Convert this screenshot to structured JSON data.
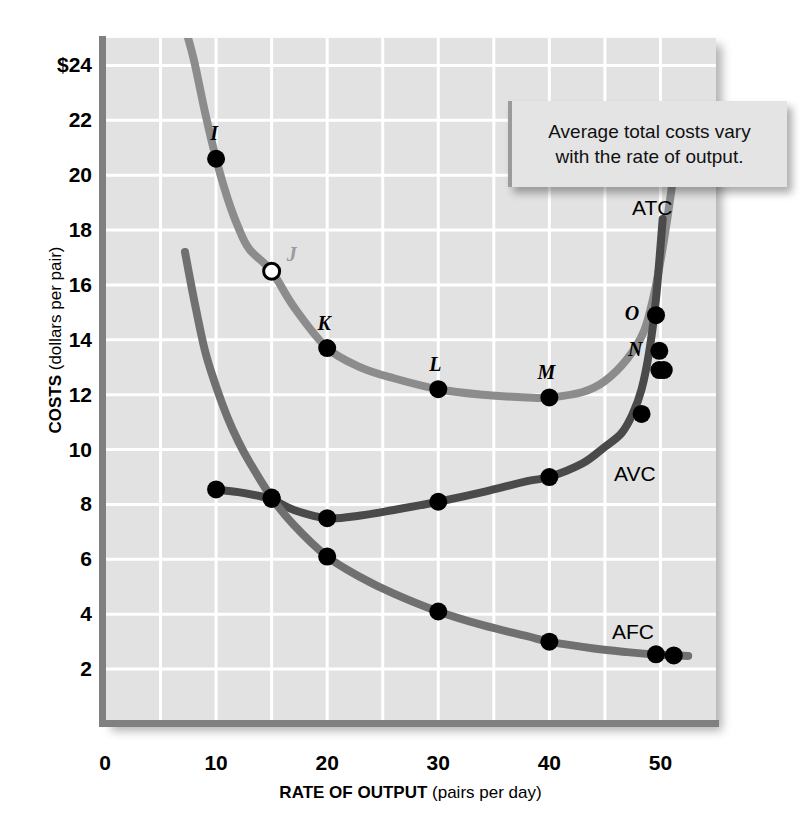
{
  "callout": {
    "line1": "Average total costs vary",
    "line2": "with the rate of output."
  },
  "axes": {
    "y_title_strong": "COSTS",
    "y_title_rest": " (dollars per pair)",
    "x_title_strong": "RATE OF OUTPUT",
    "x_title_rest": " (pairs per day)",
    "y_ticks": [
      "$24",
      "22",
      "20",
      "18",
      "16",
      "14",
      "12",
      "10",
      "8",
      "6",
      "4",
      "2"
    ],
    "y_tick_values": [
      24,
      22,
      20,
      18,
      16,
      14,
      12,
      10,
      8,
      6,
      4,
      2
    ],
    "x_ticks": [
      "0",
      "10",
      "20",
      "30",
      "40",
      "50"
    ],
    "x_tick_values": [
      0,
      10,
      20,
      30,
      40,
      50
    ]
  },
  "colors": {
    "panel_bg": "#e2e2e2",
    "grid": "#ffffff",
    "axis": "#808080",
    "atc": "#8c8c8c",
    "avc": "#4a4a4a",
    "afc": "#707070",
    "marker": "#000000",
    "marker_open_fill": "#ffffff"
  },
  "curve_labels": [
    {
      "name": "ATC",
      "x": 632,
      "y": 196
    },
    {
      "name": "AVC",
      "x": 614,
      "y": 462
    },
    {
      "name": "AFC",
      "x": 612,
      "y": 620
    }
  ],
  "chart_data": {
    "type": "line",
    "title": "",
    "xlabel": "RATE OF OUTPUT (pairs per day)",
    "ylabel": "COSTS (dollars per pair)",
    "xlim": [
      0,
      55
    ],
    "ylim": [
      0,
      25
    ],
    "grid": true,
    "grid_x_step": 5,
    "grid_y_step": 2,
    "legend": "inline-curve-labels",
    "series": [
      {
        "name": "ATC",
        "color": "#8c8c8c",
        "x": [
          7.2,
          8,
          9,
          10,
          11,
          12,
          13,
          15,
          17,
          20,
          23,
          26,
          30,
          34,
          38,
          40,
          43,
          45,
          47,
          48.5,
          49.5,
          50.3,
          51,
          51.5
        ],
        "y": [
          25.4,
          24.2,
          22.3,
          20.6,
          19.2,
          18.1,
          17.3,
          16.5,
          15.2,
          13.7,
          13.0,
          12.6,
          12.2,
          12.0,
          11.9,
          11.9,
          12.1,
          12.5,
          13.3,
          14.3,
          15.8,
          17.6,
          19.5,
          21.2
        ],
        "markers": [
          {
            "label": "I",
            "x": 10,
            "y": 20.6,
            "style": "filled",
            "label_dx": -2,
            "label_dy": -26
          },
          {
            "label": "J",
            "x": 15,
            "y": 16.5,
            "style": "open",
            "label_dx": 20,
            "label_dy": -17,
            "label_muted": true
          },
          {
            "label": "K",
            "x": 20,
            "y": 13.7,
            "style": "filled",
            "label_dx": -3,
            "label_dy": -25
          },
          {
            "label": "L",
            "x": 30,
            "y": 12.2,
            "style": "filled",
            "label_dx": -3,
            "label_dy": -25
          },
          {
            "label": "M",
            "x": 40,
            "y": 11.9,
            "style": "filled",
            "label_dx": -3,
            "label_dy": -25
          },
          {
            "label": "O",
            "x": 49.6,
            "y": 14.9,
            "style": "filled",
            "label_dx": -24,
            "label_dy": -2
          },
          {
            "label": "N",
            "x": 49.9,
            "y": 13.6,
            "style": "filled",
            "label_dx": -24,
            "label_dy": -2
          },
          {
            "label": "",
            "x": 50.3,
            "y": 12.9,
            "style": "filled"
          }
        ]
      },
      {
        "name": "AVC",
        "color": "#4a4a4a",
        "x": [
          10,
          12,
          14,
          15,
          17,
          20,
          23,
          26,
          30,
          34,
          38,
          40,
          43,
          45,
          46.5,
          47.5,
          48.3,
          49,
          49.6,
          50.2
        ],
        "y": [
          8.55,
          8.45,
          8.3,
          8.2,
          7.8,
          7.5,
          7.6,
          7.8,
          8.1,
          8.45,
          8.85,
          9.0,
          9.5,
          10.1,
          10.6,
          11.3,
          12.2,
          13.6,
          15.5,
          18.4
        ],
        "markers": [
          {
            "label": "",
            "x": 10,
            "y": 8.55,
            "style": "filled"
          },
          {
            "label": "",
            "x": 15,
            "y": 8.2,
            "style": "filled"
          },
          {
            "label": "",
            "x": 20,
            "y": 7.5,
            "style": "filled"
          },
          {
            "label": "",
            "x": 30,
            "y": 8.1,
            "style": "filled"
          },
          {
            "label": "",
            "x": 40,
            "y": 9.0,
            "style": "filled"
          },
          {
            "label": "",
            "x": 48.3,
            "y": 11.3,
            "style": "filled"
          },
          {
            "label": "",
            "x": 49.9,
            "y": 12.9,
            "style": "filled"
          }
        ]
      },
      {
        "name": "AFC",
        "color": "#707070",
        "x": [
          7.2,
          8,
          9,
          10,
          11,
          12,
          13,
          15,
          17,
          20,
          23,
          26,
          30,
          34,
          38,
          40,
          44,
          47,
          50,
          51.2,
          52.5
        ],
        "y": [
          17.2,
          15.5,
          13.6,
          12.3,
          11.2,
          10.3,
          9.55,
          8.25,
          7.25,
          6.1,
          5.35,
          4.75,
          4.1,
          3.6,
          3.2,
          3.0,
          2.75,
          2.62,
          2.52,
          2.5,
          2.48
        ],
        "markers": [
          {
            "label": "",
            "x": 15,
            "y": 8.25,
            "style": "filled"
          },
          {
            "label": "",
            "x": 20,
            "y": 6.1,
            "style": "filled"
          },
          {
            "label": "",
            "x": 30,
            "y": 4.1,
            "style": "filled"
          },
          {
            "label": "",
            "x": 40,
            "y": 3.0,
            "style": "filled"
          },
          {
            "label": "",
            "x": 49.6,
            "y": 2.54,
            "style": "filled"
          },
          {
            "label": "",
            "x": 51.2,
            "y": 2.5,
            "style": "filled"
          }
        ]
      }
    ]
  }
}
